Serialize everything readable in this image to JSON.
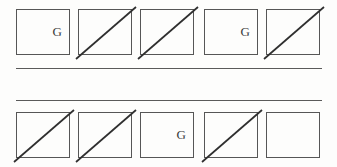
{
  "page": {
    "background_color": "#fdfdfc",
    "stroke_color": "#565656",
    "slash_color": "#2f2f2f",
    "text_color": "#3a3a3a",
    "width": 337,
    "height": 167
  },
  "rows": [
    {
      "name": "top-row",
      "top": 9,
      "cells": [
        {
          "index": 1,
          "left": 16,
          "mark": "letter",
          "letter": "G"
        },
        {
          "index": 2,
          "left": 78,
          "mark": "diagonal",
          "letter": ""
        },
        {
          "index": 3,
          "left": 140,
          "mark": "diagonal",
          "letter": ""
        },
        {
          "index": 4,
          "left": 204,
          "mark": "letter",
          "letter": "G"
        },
        {
          "index": 5,
          "left": 266,
          "mark": "diagonal",
          "letter": ""
        }
      ]
    },
    {
      "name": "bottom-row",
      "top": 112,
      "cells": [
        {
          "index": 1,
          "left": 16,
          "mark": "diagonal",
          "letter": ""
        },
        {
          "index": 2,
          "left": 78,
          "mark": "diagonal",
          "letter": ""
        },
        {
          "index": 3,
          "left": 140,
          "mark": "letter",
          "letter": "G"
        },
        {
          "index": 4,
          "left": 204,
          "mark": "diagonal",
          "letter": ""
        },
        {
          "index": 5,
          "left": 266,
          "mark": "empty",
          "letter": ""
        }
      ]
    }
  ],
  "separators": [
    {
      "name": "upper-rule",
      "top": 68,
      "left": 16,
      "width": 306
    },
    {
      "name": "lower-rule",
      "top": 100,
      "left": 16,
      "width": 306
    }
  ]
}
